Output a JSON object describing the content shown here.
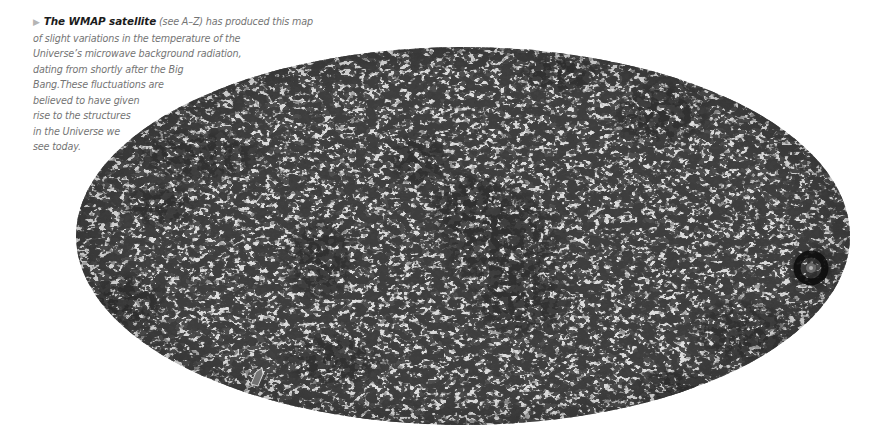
{
  "caption": {
    "arrow_icon": "right-triangle-bullet",
    "arrow_color": "#b5b5b5",
    "title": "The WMAP satellite",
    "title_color": "#1c1c1c",
    "lines": [
      " (see A–Z) has produced this map",
      "of slight variations in the temperature of the",
      "Universe’s microwave background radiation,",
      "dating from shortly after the Big",
      "Bang.These fluctuations are",
      "believed to have given",
      "rise to the structures",
      "in the Universe we",
      "see today."
    ],
    "text_color": "#747474"
  },
  "map": {
    "subject": "WMAP all-sky map of cosmic microwave background temperature fluctuations",
    "projection": "Mollweide (elliptical)",
    "palette": {
      "base_gray": "#8a8a8a",
      "light_speckle": "#c9c9c9",
      "dark_blob": "#0c0c0c"
    },
    "features": [
      "large dark cold-spot cluster near center",
      "dark ring structure near right edge",
      "dark streak bands in upper-left and upper-right",
      "small outlined artifact near lower-left rim"
    ]
  }
}
